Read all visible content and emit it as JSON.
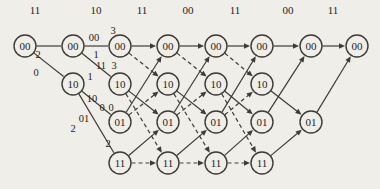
{
  "figure_type": "viterbi-trellis-diagram",
  "trellis": {
    "background_color": "#f0eee8",
    "line_color": "#3d3c38",
    "text_color": "#262420",
    "node_radius": 11,
    "node_font_size": 11,
    "label_font_size": 10.5,
    "received_font_size": 11,
    "received_y": 10,
    "received_labels": [
      {
        "text": "11",
        "x": 35
      },
      {
        "text": "10",
        "x": 96
      },
      {
        "text": "11",
        "x": 142
      },
      {
        "text": "00",
        "x": 188
      },
      {
        "text": "11",
        "x": 235
      },
      {
        "text": "00",
        "x": 288
      },
      {
        "text": "11",
        "x": 333
      }
    ],
    "states": [
      {
        "name": "00",
        "y": 46
      },
      {
        "name": "10",
        "y": 84
      },
      {
        "name": "01",
        "y": 122
      },
      {
        "name": "11",
        "y": 163
      }
    ],
    "columns_x": [
      25,
      73,
      120,
      168,
      216,
      262,
      311,
      357
    ],
    "nodes": [
      {
        "col": 0,
        "state": "00"
      },
      {
        "col": 1,
        "state": "00"
      },
      {
        "col": 1,
        "state": "10"
      },
      {
        "col": 2,
        "state": "00"
      },
      {
        "col": 2,
        "state": "10"
      },
      {
        "col": 2,
        "state": "01"
      },
      {
        "col": 2,
        "state": "11"
      },
      {
        "col": 3,
        "state": "00"
      },
      {
        "col": 3,
        "state": "10"
      },
      {
        "col": 3,
        "state": "01"
      },
      {
        "col": 3,
        "state": "11"
      },
      {
        "col": 4,
        "state": "00"
      },
      {
        "col": 4,
        "state": "10"
      },
      {
        "col": 4,
        "state": "01"
      },
      {
        "col": 4,
        "state": "11"
      },
      {
        "col": 5,
        "state": "00"
      },
      {
        "col": 5,
        "state": "10"
      },
      {
        "col": 5,
        "state": "01"
      },
      {
        "col": 5,
        "state": "11"
      },
      {
        "col": 6,
        "state": "00"
      },
      {
        "col": 6,
        "state": "01"
      },
      {
        "col": 7,
        "state": "00"
      }
    ],
    "edges": [
      {
        "fc": 0,
        "fs": "00",
        "tc": 1,
        "ts": "00",
        "style": "solid",
        "arrow": false
      },
      {
        "fc": 0,
        "fs": "00",
        "tc": 1,
        "ts": "10",
        "style": "solid",
        "arrow": false
      },
      {
        "fc": 1,
        "fs": "00",
        "tc": 2,
        "ts": "00",
        "style": "solid",
        "arrow": false
      },
      {
        "fc": 1,
        "fs": "00",
        "tc": 2,
        "ts": "10",
        "style": "solid",
        "arrow": false
      },
      {
        "fc": 1,
        "fs": "10",
        "tc": 2,
        "ts": "01",
        "style": "solid",
        "arrow": false
      },
      {
        "fc": 1,
        "fs": "10",
        "tc": 2,
        "ts": "11",
        "style": "solid",
        "arrow": false
      },
      {
        "fc": 2,
        "fs": "00",
        "tc": 3,
        "ts": "00",
        "style": "solid",
        "arrow": true
      },
      {
        "fc": 2,
        "fs": "01",
        "tc": 3,
        "ts": "00",
        "style": "solid",
        "arrow": true
      },
      {
        "fc": 2,
        "fs": "00",
        "tc": 3,
        "ts": "10",
        "style": "dashed",
        "arrow": true
      },
      {
        "fc": 2,
        "fs": "01",
        "tc": 3,
        "ts": "10",
        "style": "dashed",
        "arrow": true
      },
      {
        "fc": 2,
        "fs": "10",
        "tc": 3,
        "ts": "01",
        "style": "solid",
        "arrow": true
      },
      {
        "fc": 2,
        "fs": "11",
        "tc": 3,
        "ts": "01",
        "style": "solid",
        "arrow": true
      },
      {
        "fc": 2,
        "fs": "10",
        "tc": 3,
        "ts": "11",
        "style": "dashed",
        "arrow": true
      },
      {
        "fc": 2,
        "fs": "11",
        "tc": 3,
        "ts": "11",
        "style": "dashed",
        "arrow": true
      },
      {
        "fc": 3,
        "fs": "00",
        "tc": 4,
        "ts": "00",
        "style": "solid",
        "arrow": true
      },
      {
        "fc": 3,
        "fs": "01",
        "tc": 4,
        "ts": "00",
        "style": "solid",
        "arrow": true
      },
      {
        "fc": 3,
        "fs": "00",
        "tc": 4,
        "ts": "10",
        "style": "dashed",
        "arrow": true
      },
      {
        "fc": 3,
        "fs": "01",
        "tc": 4,
        "ts": "10",
        "style": "dashed",
        "arrow": true
      },
      {
        "fc": 3,
        "fs": "10",
        "tc": 4,
        "ts": "01",
        "style": "solid",
        "arrow": true
      },
      {
        "fc": 3,
        "fs": "11",
        "tc": 4,
        "ts": "01",
        "style": "solid",
        "arrow": true
      },
      {
        "fc": 3,
        "fs": "10",
        "tc": 4,
        "ts": "11",
        "style": "dashed",
        "arrow": true
      },
      {
        "fc": 3,
        "fs": "11",
        "tc": 4,
        "ts": "11",
        "style": "dashed",
        "arrow": true
      },
      {
        "fc": 4,
        "fs": "00",
        "tc": 5,
        "ts": "00",
        "style": "solid",
        "arrow": true
      },
      {
        "fc": 4,
        "fs": "01",
        "tc": 5,
        "ts": "00",
        "style": "solid",
        "arrow": true
      },
      {
        "fc": 4,
        "fs": "00",
        "tc": 5,
        "ts": "10",
        "style": "dashed",
        "arrow": true
      },
      {
        "fc": 4,
        "fs": "01",
        "tc": 5,
        "ts": "10",
        "style": "dashed",
        "arrow": true
      },
      {
        "fc": 4,
        "fs": "10",
        "tc": 5,
        "ts": "01",
        "style": "solid",
        "arrow": true
      },
      {
        "fc": 4,
        "fs": "11",
        "tc": 5,
        "ts": "01",
        "style": "solid",
        "arrow": true
      },
      {
        "fc": 4,
        "fs": "10",
        "tc": 5,
        "ts": "11",
        "style": "dashed",
        "arrow": true
      },
      {
        "fc": 4,
        "fs": "11",
        "tc": 5,
        "ts": "11",
        "style": "dashed",
        "arrow": true
      },
      {
        "fc": 5,
        "fs": "00",
        "tc": 6,
        "ts": "00",
        "style": "solid",
        "arrow": true
      },
      {
        "fc": 5,
        "fs": "01",
        "tc": 6,
        "ts": "00",
        "style": "solid",
        "arrow": true
      },
      {
        "fc": 5,
        "fs": "10",
        "tc": 6,
        "ts": "01",
        "style": "solid",
        "arrow": true
      },
      {
        "fc": 5,
        "fs": "11",
        "tc": 6,
        "ts": "01",
        "style": "solid",
        "arrow": true
      },
      {
        "fc": 6,
        "fs": "00",
        "tc": 7,
        "ts": "00",
        "style": "solid",
        "arrow": true
      },
      {
        "fc": 6,
        "fs": "01",
        "tc": 7,
        "ts": "00",
        "style": "solid",
        "arrow": true
      }
    ],
    "annotations": [
      {
        "text": "2",
        "x": 38,
        "y": 54
      },
      {
        "text": "0",
        "x": 36,
        "y": 72
      },
      {
        "text": "00",
        "x": 94,
        "y": 37
      },
      {
        "text": "3",
        "x": 113,
        "y": 30
      },
      {
        "text": "1",
        "x": 96,
        "y": 54
      },
      {
        "text": "11",
        "x": 101,
        "y": 65
      },
      {
        "text": "3",
        "x": 114,
        "y": 65
      },
      {
        "text": "1",
        "x": 90,
        "y": 76
      },
      {
        "text": "10",
        "x": 92,
        "y": 98
      },
      {
        "text": "0",
        "x": 102,
        "y": 107
      },
      {
        "text": "0",
        "x": 111,
        "y": 107
      },
      {
        "text": "01",
        "x": 84,
        "y": 118
      },
      {
        "text": "2",
        "x": 73,
        "y": 128
      },
      {
        "text": "2",
        "x": 108,
        "y": 143
      }
    ]
  }
}
